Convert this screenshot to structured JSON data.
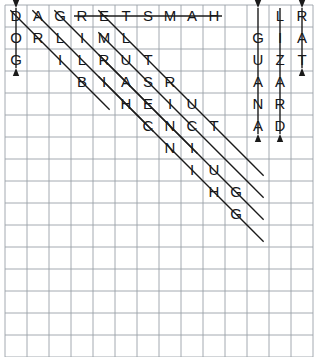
{
  "puzzle": {
    "title": "word-search-grid",
    "grid": {
      "cols": 14,
      "rows": 16,
      "cell_size": 22,
      "origin_x": 5,
      "origin_y": 5,
      "line_color_minor": "#c9ccd2",
      "line_color_major": "#9aa0a8",
      "major_every": 1
    },
    "letter_color": "#14161a",
    "mark_color": "#1a1a1a",
    "letters": [
      {
        "row": 1,
        "col": 1,
        "char": "D"
      },
      {
        "row": 1,
        "col": 2,
        "char": "A"
      },
      {
        "row": 1,
        "col": 3,
        "char": "G"
      },
      {
        "row": 1,
        "col": 4,
        "char": "R"
      },
      {
        "row": 1,
        "col": 5,
        "char": "E"
      },
      {
        "row": 1,
        "col": 6,
        "char": "T"
      },
      {
        "row": 1,
        "col": 7,
        "char": "S"
      },
      {
        "row": 1,
        "col": 8,
        "char": "M"
      },
      {
        "row": 1,
        "col": 9,
        "char": "A"
      },
      {
        "row": 1,
        "col": 10,
        "char": "H"
      },
      {
        "row": 1,
        "col": 13,
        "char": "L"
      },
      {
        "row": 1,
        "col": 14,
        "char": "R"
      },
      {
        "row": 2,
        "col": 1,
        "char": "O"
      },
      {
        "row": 2,
        "col": 2,
        "char": "R"
      },
      {
        "row": 2,
        "col": 3,
        "char": "L"
      },
      {
        "row": 2,
        "col": 4,
        "char": "I"
      },
      {
        "row": 2,
        "col": 5,
        "char": "M"
      },
      {
        "row": 2,
        "col": 6,
        "char": "L"
      },
      {
        "row": 2,
        "col": 12,
        "char": "G"
      },
      {
        "row": 2,
        "col": 13,
        "char": "I"
      },
      {
        "row": 2,
        "col": 14,
        "char": "A"
      },
      {
        "row": 3,
        "col": 1,
        "char": "G"
      },
      {
        "row": 3,
        "col": 3,
        "char": "I"
      },
      {
        "row": 3,
        "col": 4,
        "char": "L"
      },
      {
        "row": 3,
        "col": 5,
        "char": "R"
      },
      {
        "row": 3,
        "col": 6,
        "char": "U"
      },
      {
        "row": 3,
        "col": 7,
        "char": "T"
      },
      {
        "row": 3,
        "col": 12,
        "char": "U"
      },
      {
        "row": 3,
        "col": 13,
        "char": "Z"
      },
      {
        "row": 3,
        "col": 14,
        "char": "T"
      },
      {
        "row": 4,
        "col": 4,
        "char": "B"
      },
      {
        "row": 4,
        "col": 5,
        "char": "I"
      },
      {
        "row": 4,
        "col": 6,
        "char": "A"
      },
      {
        "row": 4,
        "col": 7,
        "char": "S"
      },
      {
        "row": 4,
        "col": 8,
        "char": "R"
      },
      {
        "row": 4,
        "col": 12,
        "char": "A"
      },
      {
        "row": 4,
        "col": 13,
        "char": "A"
      },
      {
        "row": 5,
        "col": 6,
        "char": "H"
      },
      {
        "row": 5,
        "col": 7,
        "char": "E"
      },
      {
        "row": 5,
        "col": 8,
        "char": "I"
      },
      {
        "row": 5,
        "col": 9,
        "char": "U"
      },
      {
        "row": 5,
        "col": 12,
        "char": "N"
      },
      {
        "row": 5,
        "col": 13,
        "char": "R"
      },
      {
        "row": 6,
        "col": 7,
        "char": "C"
      },
      {
        "row": 6,
        "col": 8,
        "char": "N"
      },
      {
        "row": 6,
        "col": 9,
        "char": "C"
      },
      {
        "row": 6,
        "col": 10,
        "char": "T"
      },
      {
        "row": 6,
        "col": 12,
        "char": "A"
      },
      {
        "row": 6,
        "col": 13,
        "char": "D"
      },
      {
        "row": 7,
        "col": 8,
        "char": "N"
      },
      {
        "row": 7,
        "col": 9,
        "char": "I"
      },
      {
        "row": 8,
        "col": 9,
        "char": "I"
      },
      {
        "row": 8,
        "col": 10,
        "char": "U"
      },
      {
        "row": 9,
        "col": 10,
        "char": "H"
      },
      {
        "row": 9,
        "col": 11,
        "char": "G"
      },
      {
        "row": 10,
        "col": 11,
        "char": "G"
      }
    ],
    "marks": [
      {
        "name": "strike-vertical-dog",
        "from_row": 1,
        "from_col": 1,
        "to_row": 3,
        "to_col": 1,
        "arrow": "both"
      },
      {
        "name": "strike-horizontal-hamster",
        "from_row": 1,
        "from_col": 4,
        "to_row": 1,
        "to_col": 10,
        "arrow": "none"
      },
      {
        "name": "strike-vertical-guana",
        "from_row": 1,
        "from_col": 12,
        "to_row": 6,
        "to_col": 12,
        "arrow": "both"
      },
      {
        "name": "strike-vertical-lizard",
        "from_row": 1,
        "from_col": 13,
        "to_row": 6,
        "to_col": 13,
        "arrow": "end"
      },
      {
        "name": "strike-vertical-rat",
        "from_row": 1,
        "from_col": 14,
        "to_row": 3,
        "to_col": 14,
        "arrow": "both"
      },
      {
        "name": "strike-diagonal-1",
        "from_row": 1,
        "from_col": 1,
        "to_row": 5,
        "to_col": 5,
        "arrow": "none"
      },
      {
        "name": "strike-diagonal-2",
        "from_row": 1,
        "from_col": 2,
        "to_row": 6,
        "to_col": 7,
        "arrow": "none"
      },
      {
        "name": "strike-diagonal-3",
        "from_row": 1,
        "from_col": 3,
        "to_row": 7,
        "to_col": 9,
        "arrow": "none"
      },
      {
        "name": "strike-diagonal-4",
        "from_row": 1,
        "from_col": 5,
        "to_row": 8,
        "to_col": 12,
        "arrow": "none"
      },
      {
        "name": "strike-diagonal-5",
        "from_row": 2,
        "from_col": 5,
        "to_row": 9,
        "to_col": 12,
        "arrow": "none"
      },
      {
        "name": "strike-diagonal-6",
        "from_row": 3,
        "from_col": 5,
        "to_row": 10,
        "to_col": 12,
        "arrow": "none"
      },
      {
        "name": "strike-diagonal-7",
        "from_row": 4,
        "from_col": 5,
        "to_row": 11,
        "to_col": 12,
        "arrow": "none"
      }
    ]
  }
}
